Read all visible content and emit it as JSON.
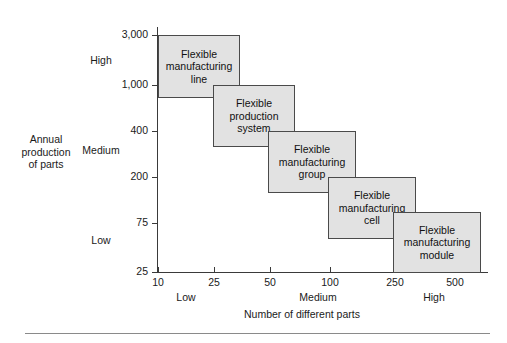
{
  "chart_data": {
    "type": "scatter",
    "title": "",
    "xlabel": "Number of different parts",
    "ylabel": "Annual production of parts",
    "grid": false,
    "legend": "none",
    "x_scale": "log",
    "y_scale": "log",
    "x_ticks": [
      "10",
      "25",
      "50",
      "100",
      "250",
      "500"
    ],
    "y_ticks": [
      "3,000",
      "1,000",
      "400",
      "200",
      "75",
      "25"
    ],
    "x_categories": [
      "Low",
      "Medium",
      "High"
    ],
    "y_categories": [
      "High",
      "Medium",
      "Low"
    ],
    "xlim": [
      10,
      900
    ],
    "ylim": [
      25,
      3000
    ],
    "boxes": [
      {
        "label": "Flexible\nmanufacturing\nline",
        "x_range": [
          10,
          35
        ],
        "y_range": [
          800,
          3000
        ]
      },
      {
        "label": "Flexible\nproduction\nsystem",
        "x_range": [
          25,
          80
        ],
        "y_range": [
          380,
          1000
        ]
      },
      {
        "label": "Flexible\nmanufacturing\ngroup",
        "x_range": [
          58,
          170
        ],
        "y_range": [
          190,
          430
        ]
      },
      {
        "label": "Flexible\nmanufacturing\ncell",
        "x_range": [
          125,
          330
        ],
        "y_range": [
          85,
          210
        ]
      },
      {
        "label": "Flexible\nmanufacturing\nmodule",
        "x_range": [
          300,
          800
        ],
        "y_range": [
          25,
          95
        ]
      }
    ]
  },
  "axes": {
    "y_title": "Annual\nproduction\nof parts",
    "x_title": "Number of different parts",
    "y_tick_labels": [
      "3,000",
      "1,000",
      "400",
      "200",
      "75",
      "25"
    ],
    "y_tick_positions": [
      35,
      85,
      131,
      177,
      223,
      272
    ],
    "x_tick_labels": [
      "10",
      "25",
      "50",
      "100",
      "250",
      "500"
    ],
    "x_tick_positions": [
      158,
      214,
      270,
      330,
      395,
      455
    ],
    "y_category_labels": [
      "High",
      "Medium",
      "Low"
    ],
    "y_category_positions": [
      60,
      150,
      240
    ],
    "x_category_labels": [
      "Low",
      "Medium",
      "High"
    ],
    "x_category_positions": [
      186,
      318,
      434
    ]
  },
  "boxes": [
    {
      "name": "flexible-manufacturing-line",
      "label": "Flexible\nmanufacturing\nline",
      "left": 158,
      "top": 35,
      "width": 82,
      "height": 63
    },
    {
      "name": "flexible-production-system",
      "label": "Flexible\nproduction\nsystem",
      "left": 213,
      "top": 85,
      "width": 82,
      "height": 62
    },
    {
      "name": "flexible-manufacturing-group",
      "label": "Flexible\nmanufacturing\ngroup",
      "left": 268,
      "top": 131,
      "width": 88,
      "height": 62
    },
    {
      "name": "flexible-manufacturing-cell",
      "label": "Flexible\nmanufacturing\ncell",
      "left": 328,
      "top": 177,
      "width": 88,
      "height": 62
    },
    {
      "name": "flexible-manufacturing-module",
      "label": "Flexible\nmanufacturing\nmodule",
      "left": 393,
      "top": 212,
      "width": 88,
      "height": 61
    }
  ],
  "colors": {
    "box_fill": "#e2e2e2",
    "box_border": "#4a4a4a",
    "axis": "#3a3a3a",
    "text": "#1a1a1a",
    "rule": "#8a8a8a",
    "background": "#ffffff"
  }
}
